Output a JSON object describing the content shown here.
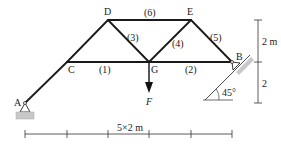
{
  "diagram": {
    "type": "truss",
    "nodes": [
      {
        "id": "A",
        "label": "A",
        "x": 25,
        "y": 103
      },
      {
        "id": "C",
        "label": "C",
        "x": 67,
        "y": 62
      },
      {
        "id": "D",
        "label": "D",
        "x": 108,
        "y": 20
      },
      {
        "id": "G",
        "label": "G",
        "x": 149,
        "y": 62
      },
      {
        "id": "E",
        "label": "E",
        "x": 191,
        "y": 20
      },
      {
        "id": "B",
        "label": "B",
        "x": 232,
        "y": 62
      }
    ],
    "members": [
      {
        "from": "A",
        "to": "C",
        "label": ""
      },
      {
        "from": "C",
        "to": "D",
        "label": ""
      },
      {
        "from": "C",
        "to": "G",
        "label": "(1)"
      },
      {
        "from": "G",
        "to": "B",
        "label": "(2)"
      },
      {
        "from": "D",
        "to": "G",
        "label": "(3)"
      },
      {
        "from": "G",
        "to": "E",
        "label": "(4)"
      },
      {
        "from": "E",
        "to": "B",
        "label": "(5)"
      },
      {
        "from": "D",
        "to": "E",
        "label": "(6)"
      }
    ],
    "load": {
      "node": "G",
      "label": "F",
      "direction": "down"
    },
    "supports": [
      {
        "node": "A",
        "type": "pin"
      },
      {
        "node": "B",
        "type": "roller on 45° incline"
      }
    ],
    "incline_angle_label": "45°",
    "dimensions": {
      "horizontal_label": "5×2 m",
      "vertical_top_label": "2 m",
      "vertical_bottom_label": "2"
    }
  }
}
